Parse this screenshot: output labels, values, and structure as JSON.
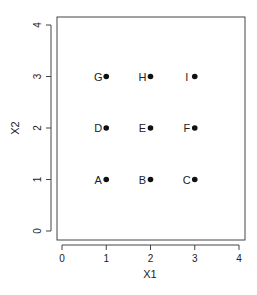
{
  "chart_data": {
    "type": "scatter",
    "title": "",
    "xlabel": "X1",
    "ylabel": "X2",
    "xlim": [
      0,
      4
    ],
    "ylim": [
      0,
      4
    ],
    "grid": false,
    "legend": null,
    "x_ticks": [
      "0",
      "1",
      "2",
      "3",
      "4"
    ],
    "y_ticks": [
      "0",
      "1",
      "2",
      "3",
      "4"
    ],
    "points": [
      {
        "label": "A",
        "x": 1,
        "y": 1
      },
      {
        "label": "B",
        "x": 2,
        "y": 1
      },
      {
        "label": "C",
        "x": 3,
        "y": 1
      },
      {
        "label": "D",
        "x": 1,
        "y": 2
      },
      {
        "label": "E",
        "x": 2,
        "y": 2
      },
      {
        "label": "F",
        "x": 3,
        "y": 2
      },
      {
        "label": "G",
        "x": 1,
        "y": 3
      },
      {
        "label": "H",
        "x": 2,
        "y": 3
      },
      {
        "label": "I",
        "x": 3,
        "y": 3
      }
    ],
    "point_color": "#111111",
    "label_position": "left"
  }
}
